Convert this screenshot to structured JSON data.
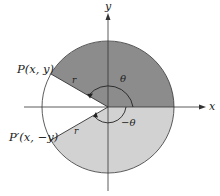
{
  "diagram": {
    "axes": {
      "x_label": "x",
      "y_label": "y"
    },
    "points": {
      "p": {
        "label": "P(x,  y)"
      },
      "p_prime": {
        "label": "P′(x,  −y)"
      }
    },
    "radius_labels": {
      "upper": "r",
      "lower": "r"
    },
    "angles": {
      "positive": "θ",
      "negative": "−θ"
    },
    "colors": {
      "upper_region": "#8c8c8c",
      "lower_region": "#cfcfcf",
      "outline": "#333333",
      "background": "#ffffff"
    }
  }
}
